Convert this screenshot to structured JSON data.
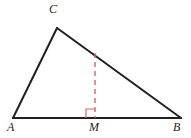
{
  "figure": {
    "kind": "geometry-diagram",
    "background_color": "#ffffff",
    "stroke_color": "#231f20",
    "accent_color": "#d9606a",
    "width": 191,
    "height": 138
  },
  "labels": {
    "a": "A",
    "b": "B",
    "c": "C",
    "m": "M"
  },
  "points": {
    "A": {
      "x": 13,
      "y": 118
    },
    "B": {
      "x": 181,
      "y": 118
    },
    "C": {
      "x": 57,
      "y": 28
    },
    "M": {
      "x": 95,
      "y": 118
    },
    "H": {
      "x": 95,
      "y": 53
    }
  },
  "segments": [
    {
      "name": "side-AC",
      "from": "A",
      "to": "C",
      "style": "solid",
      "color": "#231f20",
      "width": 2
    },
    {
      "name": "side-CB",
      "from": "C",
      "to": "B",
      "style": "solid",
      "color": "#231f20",
      "width": 2
    },
    {
      "name": "side-AB",
      "from": "A",
      "to": "B",
      "style": "solid",
      "color": "#231f20",
      "width": 2
    },
    {
      "name": "altitude-HM",
      "from": "H",
      "to": "M",
      "style": "dashed",
      "color": "#d9606a",
      "width": 1.4
    }
  ],
  "right_angle_marker": {
    "name": "right-angle-at-M",
    "color": "#d9606a",
    "size": 9,
    "vertex": {
      "x": 95,
      "y": 118
    },
    "orientation": "left-of-altitude"
  }
}
